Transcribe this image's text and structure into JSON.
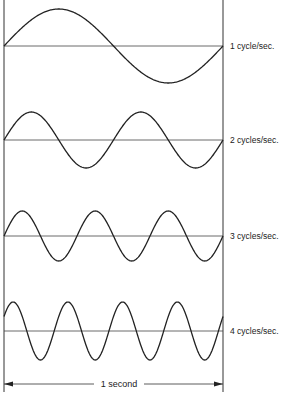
{
  "figure": {
    "left_x": 4,
    "right_x": 223,
    "top_y": 0,
    "bottom_y": 392,
    "line_color": "#333333",
    "waves": [
      {
        "cycles": 1,
        "label": "1 cycle/sec.",
        "axis_y": 46,
        "amplitude": 37,
        "phase_deg": 0,
        "label_y": 41
      },
      {
        "cycles": 2,
        "label": "2 cycles/sec.",
        "axis_y": 140,
        "amplitude": 28,
        "phase_deg": 0,
        "label_y": 135
      },
      {
        "cycles": 3,
        "label": "3 cycles/sec.",
        "axis_y": 236,
        "amplitude": 25,
        "phase_deg": 0,
        "label_y": 231
      },
      {
        "cycles": 4,
        "label": "4 cycles/sec.",
        "axis_y": 331,
        "amplitude": 29,
        "phase_deg": 30,
        "label_y": 326
      }
    ],
    "dimension": {
      "label": "1 second",
      "y": 384
    }
  }
}
